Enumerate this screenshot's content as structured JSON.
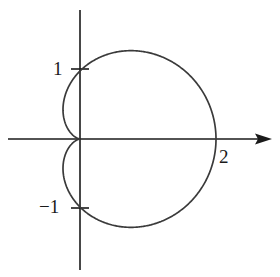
{
  "figure": {
    "title": "",
    "background_color": "#ffffff",
    "curve_color": "#3a3a3a",
    "axis_color": "#1a1a1a",
    "label_color": "#1a1a1a"
  },
  "axes": {
    "x_axis": {
      "name": "x-axis",
      "arrowhead": "right",
      "start_px": 8,
      "end_px": 272,
      "y_px": 139
    },
    "y_axis": {
      "name": "y-axis",
      "arrowhead": "none",
      "start_px": 10,
      "end_px": 270,
      "x_px": 80
    },
    "origin": {
      "x_px": 80,
      "y_px": 139
    },
    "unit_px": 68
  },
  "ticks": [
    {
      "axis": "y",
      "value": 1,
      "label": "1",
      "x_px": 80,
      "y_px": 69
    },
    {
      "axis": "y",
      "value": -1,
      "label": "−1",
      "x_px": 80,
      "y_px": 208
    },
    {
      "axis": "x",
      "value": 2,
      "label": "2",
      "x_px": 216,
      "y_px": 139
    }
  ],
  "chart_data": {
    "type": "line",
    "title": "",
    "subtitle": "",
    "xlabel": "",
    "ylabel": "",
    "grid": false,
    "legend": null,
    "curve_name": "cardioid",
    "equation": "r = 1 + cos θ",
    "coordinate_system": "polar",
    "xlim": [
      -1.06,
      2.82
    ],
    "ylim": [
      -2.03,
      1.9
    ],
    "tick_labels": [
      "1",
      "−1",
      "2"
    ],
    "key_points": [
      {
        "label": "cusp",
        "x": 0,
        "y": 0,
        "theta_deg": 180,
        "r": 0
      },
      {
        "label": "max-x",
        "x": 2,
        "y": 0,
        "theta_deg": 0,
        "r": 2
      },
      {
        "label": "y-crossing-upper",
        "x": 0,
        "y": 1,
        "theta_deg": 90,
        "r": 1
      },
      {
        "label": "y-crossing-lower",
        "x": 0,
        "y": -1,
        "theta_deg": 270,
        "r": 1
      },
      {
        "label": "top",
        "x": 0.75,
        "y": 1.3,
        "theta_deg": 60,
        "r": 1.5
      },
      {
        "label": "bottom",
        "x": 0.75,
        "y": -1.3,
        "theta_deg": 300,
        "r": 1.5
      },
      {
        "label": "leftmost",
        "x": -0.25,
        "y": 0.43,
        "theta_deg": 120,
        "r": 0.5
      }
    ],
    "theta_deg": [
      0,
      15,
      30,
      45,
      60,
      75,
      90,
      105,
      120,
      135,
      150,
      165,
      180,
      195,
      210,
      225,
      240,
      255,
      270,
      285,
      300,
      315,
      330,
      345,
      360
    ],
    "r": [
      2.0,
      1.966,
      1.866,
      1.707,
      1.5,
      1.259,
      1.0,
      0.741,
      0.5,
      0.293,
      0.134,
      0.034,
      0.0,
      0.034,
      0.134,
      0.293,
      0.5,
      0.741,
      1.0,
      1.259,
      1.5,
      1.707,
      1.866,
      1.966,
      2.0
    ],
    "x": [
      2.0,
      1.899,
      1.616,
      1.207,
      0.75,
      0.326,
      0.0,
      -0.192,
      -0.25,
      -0.207,
      -0.116,
      -0.033,
      0.0,
      -0.033,
      -0.116,
      -0.207,
      -0.25,
      -0.192,
      0.0,
      0.326,
      0.75,
      1.207,
      1.616,
      1.899,
      2.0
    ],
    "y": [
      0.0,
      0.509,
      0.933,
      1.207,
      1.299,
      1.216,
      1.0,
      0.716,
      0.433,
      0.207,
      0.067,
      0.009,
      0.0,
      -0.009,
      -0.067,
      -0.207,
      -0.433,
      -0.716,
      -1.0,
      -1.216,
      -1.299,
      -1.207,
      -0.933,
      -0.509,
      0.0
    ]
  }
}
